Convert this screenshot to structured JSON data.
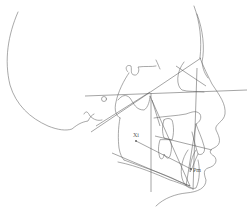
{
  "diagram": {
    "type": "cephalometric-tracing",
    "view": "lateral-profile",
    "colors": {
      "stroke": "#6e6e6e",
      "background": "#ffffff",
      "label": "#555555"
    },
    "landmarks": [
      {
        "id": "xi",
        "label": "Xi",
        "x": 136,
        "y": 141
      },
      {
        "id": "pm",
        "label": "Pm",
        "x": 191,
        "y": 169
      }
    ],
    "reference_lines": [
      {
        "id": "frankfort-horizontal",
        "x1": 85,
        "y1": 96,
        "x2": 247,
        "y2": 90
      },
      {
        "id": "sn-line",
        "x1": 91,
        "y1": 132,
        "x2": 201,
        "y2": 58
      },
      {
        "id": "vertical-ptv",
        "x1": 151,
        "y1": 93,
        "x2": 151,
        "y2": 192
      },
      {
        "id": "facial-axis",
        "x1": 196,
        "y1": 69,
        "x2": 193,
        "y2": 190
      },
      {
        "id": "mandibular-plane",
        "x1": 112,
        "y1": 153,
        "x2": 190,
        "y2": 186
      },
      {
        "id": "occlusal-plane",
        "x1": 155,
        "y1": 136,
        "x2": 212,
        "y2": 150
      },
      {
        "id": "xi-pm-axis",
        "x1": 136,
        "y1": 141,
        "x2": 191,
        "y2": 169
      },
      {
        "id": "n-pog-line",
        "x1": 150,
        "y1": 96,
        "x2": 190,
        "y2": 186
      }
    ]
  }
}
